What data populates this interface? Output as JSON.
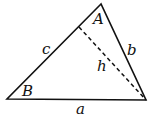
{
  "diagram": {
    "type": "triangle",
    "vertices": {
      "A": {
        "x": 101,
        "y": 4
      },
      "B": {
        "x": 7,
        "y": 99
      },
      "C": {
        "x": 146,
        "y": 100
      }
    },
    "altitude_foot": {
      "x": 79,
      "y": 27
    },
    "labels": {
      "A": {
        "text": "A",
        "x": 93,
        "y": 24
      },
      "B": {
        "text": "B",
        "x": 23,
        "y": 96
      },
      "a": {
        "text": "a",
        "x": 76,
        "y": 114
      },
      "b": {
        "text": "b",
        "x": 126,
        "y": 55
      },
      "c": {
        "text": "c",
        "x": 42,
        "y": 54
      },
      "h": {
        "text": "h",
        "x": 97,
        "y": 71
      }
    },
    "stroke_color": "#111111"
  }
}
